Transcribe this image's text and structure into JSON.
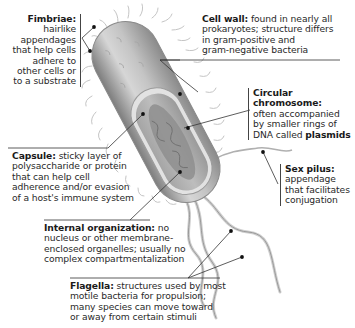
{
  "diagram": {
    "labels": [
      {
        "id": "fimbriae",
        "term": "Fimbriae:",
        "description": "hairlike appendages that help cells adhere to other cells or to a substrate",
        "lines": [
          "hairlike",
          "appendages",
          "that help cells",
          "adhere to",
          "other cells or",
          "to a substrate"
        ]
      },
      {
        "id": "cell-wall",
        "term": "Cell wall:",
        "description": "found in nearly all prokaryotes; structure differs in gram-positive and gram-negative bacteria",
        "lines": [
          "found in nearly all",
          "prokaryotes; structure differs",
          "in gram-positive and",
          "gram-negative bacteria"
        ]
      },
      {
        "id": "circular-chromosome",
        "term": "Circular chromosome:",
        "description": "often accompanied by smaller rings of DNA called plasmids",
        "lines": [
          "often accompanied",
          "by smaller rings of",
          "DNA called "
        ],
        "emphasis": "plasmids"
      },
      {
        "id": "capsule",
        "term": "Capsule:",
        "description": "sticky layer of polysaccharide or protein that can help cell adherence and/or evasion of a host's immune system",
        "lines": [
          "sticky layer of",
          "polysaccharide or protein",
          "that can help cell",
          "adherence and/or evasion",
          "of a host's immune system"
        ]
      },
      {
        "id": "sex-pilus",
        "term": "Sex pilus:",
        "description": "appendage that facilitates conjugation",
        "lines": [
          "appendage",
          "that facilitates",
          "conjugation"
        ]
      },
      {
        "id": "internal-organization",
        "term": "Internal organization:",
        "description": "no nucleus or other membrane-enclosed organelles; usually no complex compartmentalization",
        "lines": [
          "no",
          "nucleus or other membrane-",
          "enclosed organelles; usually no",
          "complex compartmentalization"
        ]
      },
      {
        "id": "flagella",
        "term": "Flagella:",
        "description": "structures used by most motile bacteria for propulsion; many species can move toward or away from certain stimuli",
        "lines": [
          "structures used by most",
          "motile bacteria for propulsion;",
          "many species can move toward",
          "or away from certain stimuli"
        ]
      }
    ]
  },
  "colors": {
    "cell_body": "#c9c9c9",
    "cell_shadow": "#8f8f8f",
    "cytoplasm": "#b3b3b3",
    "nucleoid": "#8d8d8d",
    "leader_line": "#333333",
    "dot": "#111111",
    "text": "#2a2a2a"
  }
}
